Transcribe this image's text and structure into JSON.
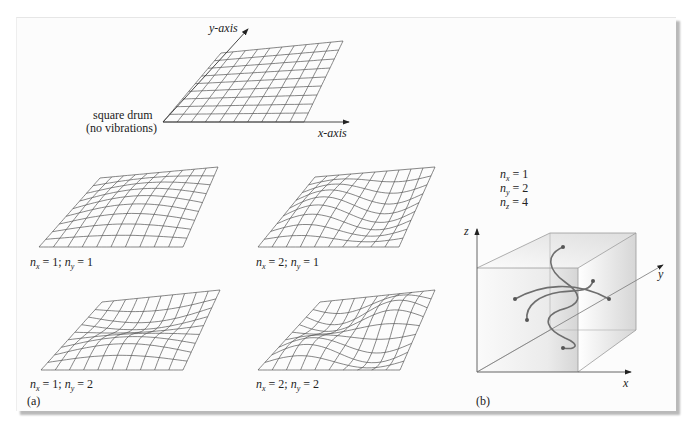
{
  "figure": {
    "panel_a": {
      "label": "(a)",
      "reference": {
        "caption_line1": "square drum",
        "caption_line2": "(no vibrations)",
        "x_axis_label": "x-axis",
        "y_axis_label": "y-axis",
        "grid": {
          "cols": 10,
          "rows": 9
        }
      },
      "modes": [
        {
          "id": "m11",
          "nx": "1",
          "ny": "1",
          "text_nx": "n",
          "sub_x": "x",
          "eq1": " = 1; ",
          "text_ny": "n",
          "sub_y": "y",
          "eq2": " = 1"
        },
        {
          "id": "m21",
          "nx": "2",
          "ny": "1",
          "text_nx": "n",
          "sub_x": "x",
          "eq1": " = 2; ",
          "text_ny": "n",
          "sub_y": "y",
          "eq2": " = 1"
        },
        {
          "id": "m12",
          "nx": "1",
          "ny": "2",
          "text_nx": "n",
          "sub_x": "x",
          "eq1": " = 1; ",
          "text_ny": "n",
          "sub_y": "y",
          "eq2": " = 2"
        },
        {
          "id": "m22",
          "nx": "2",
          "ny": "2",
          "text_nx": "n",
          "sub_x": "x",
          "eq1": " = 2; ",
          "text_ny": "n",
          "sub_y": "y",
          "eq2": " = 2"
        }
      ]
    },
    "panel_b": {
      "label": "(b)",
      "quantum_numbers": [
        {
          "n": "n",
          "sub": "x",
          "eq": " = 1"
        },
        {
          "n": "n",
          "sub": "y",
          "eq": " = 2"
        },
        {
          "n": "n",
          "sub": "z",
          "eq": " = 4"
        }
      ],
      "axes": {
        "x": "x",
        "y": "y",
        "z": "z"
      }
    },
    "colors": {
      "line": "#555555",
      "curve": "#6e6e6e",
      "cube_edge": "#9a9a9a",
      "cube_shade": "#d9d9d9"
    }
  }
}
